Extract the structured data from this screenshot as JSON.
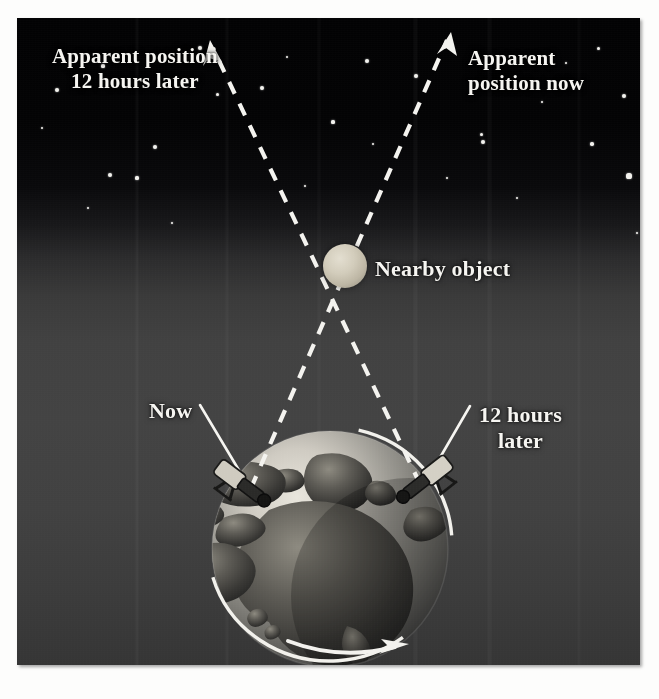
{
  "figure": {
    "background_color": "#3f3f3f",
    "sky_color": "#020203",
    "label_color": "#f6f5f1",
    "line_color": "#ffffff"
  },
  "labels": {
    "apparent_position_later": "Apparent position\n12 hours later",
    "apparent_position_now": "Apparent\nposition now",
    "nearby_object": "Nearby object",
    "observer_now": "Now",
    "observer_later": "12 hours\nlater"
  },
  "elements": {
    "nearby_object_icon": "sphere-icon",
    "left_telescope_icon": "telescope-icon",
    "right_telescope_icon": "telescope-icon",
    "rotation_arrow_icon": "curved-arrow-right-icon",
    "sight_line_left_icon": "dashed-arrow-icon",
    "sight_line_right_icon": "dashed-arrow-icon",
    "globe_icon": "earth-globe-icon",
    "equator_ring_icon": "ellipse-ring-icon"
  },
  "geometry": {
    "nearby_object_center": [
      330,
      249
    ],
    "nearby_object_radius": 22,
    "globe_center": [
      330,
      548
    ],
    "globe_radius": 118,
    "observer_now_position": [
      246,
      487
    ],
    "observer_later_position": [
      420,
      483
    ],
    "arrowhead_left_tip": [
      210,
      40
    ],
    "arrowhead_right_tip": [
      449,
      35
    ]
  },
  "stars": [
    {
      "x": 86,
      "y": 48,
      "r": 1.6
    },
    {
      "x": 183,
      "y": 30,
      "r": 2.0
    },
    {
      "x": 40,
      "y": 72,
      "r": 2.2
    },
    {
      "x": 270,
      "y": 39,
      "r": 1.4
    },
    {
      "x": 350,
      "y": 43,
      "r": 2.4
    },
    {
      "x": 399,
      "y": 58,
      "r": 2.2
    },
    {
      "x": 464,
      "y": 116,
      "r": 1.5
    },
    {
      "x": 549,
      "y": 45,
      "r": 1.3
    },
    {
      "x": 581,
      "y": 30,
      "r": 1.5
    },
    {
      "x": 607,
      "y": 78,
      "r": 2.2
    },
    {
      "x": 612,
      "y": 158,
      "r": 2.6
    },
    {
      "x": 138,
      "y": 129,
      "r": 2.3
    },
    {
      "x": 245,
      "y": 70,
      "r": 2.2
    },
    {
      "x": 316,
      "y": 104,
      "r": 1.6
    },
    {
      "x": 200,
      "y": 76,
      "r": 1.5
    },
    {
      "x": 93,
      "y": 157,
      "r": 2.0
    },
    {
      "x": 120,
      "y": 160,
      "r": 1.6
    },
    {
      "x": 466,
      "y": 124,
      "r": 2.4
    },
    {
      "x": 356,
      "y": 126,
      "r": 1.4
    },
    {
      "x": 575,
      "y": 126,
      "r": 1.8
    },
    {
      "x": 71,
      "y": 190,
      "r": 1.3
    },
    {
      "x": 525,
      "y": 84,
      "r": 1.4
    },
    {
      "x": 288,
      "y": 168,
      "r": 1.2
    },
    {
      "x": 430,
      "y": 160,
      "r": 1.2
    },
    {
      "x": 155,
      "y": 205,
      "r": 1.1
    },
    {
      "x": 620,
      "y": 215,
      "r": 1.4
    },
    {
      "x": 25,
      "y": 110,
      "r": 1.2
    },
    {
      "x": 500,
      "y": 180,
      "r": 1.1
    }
  ]
}
